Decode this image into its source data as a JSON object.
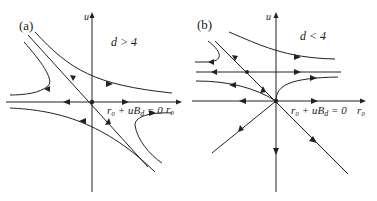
{
  "panels": [
    {
      "id": "a",
      "label": "(a)",
      "condition": "d > 4",
      "y_axis_label": "u",
      "x_axis_label": "r₀",
      "line_label": "r₀ + uB",
      "line_label_sub": "d",
      "line_label_rhs": " = 0",
      "fixed_point": "origin (saddle)"
    },
    {
      "id": "b",
      "label": "(b)",
      "condition": "d < 4",
      "y_axis_label": "u",
      "x_axis_label": "r₀",
      "line_label": "r₀ + uB",
      "line_label_sub": "d",
      "line_label_rhs": " = 0",
      "fixed_point": "Gaussian at origin, non-trivial on horizontal line"
    }
  ],
  "colors": {
    "line": "#222222",
    "background": "#ffffff"
  }
}
